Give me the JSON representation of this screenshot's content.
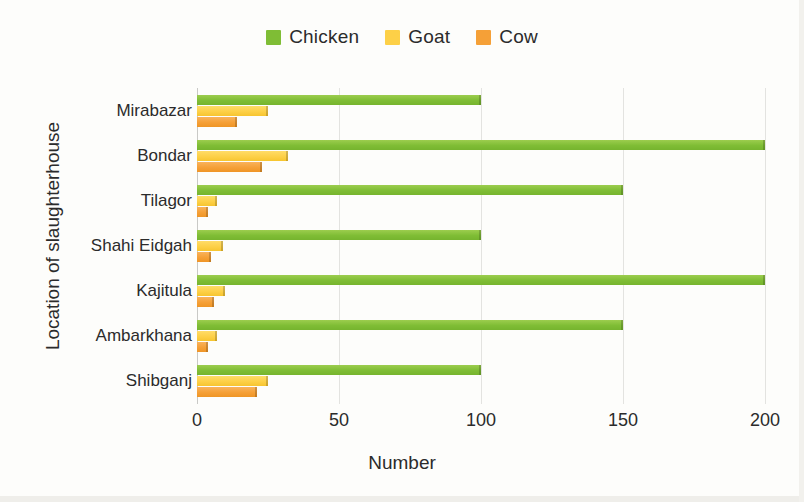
{
  "chart_data": {
    "type": "bar",
    "orientation": "horizontal",
    "title": "",
    "xlabel": "Number",
    "ylabel": "Location of slaughterhouse",
    "xlim": [
      0,
      200
    ],
    "xticks": [
      0,
      50,
      100,
      150,
      200
    ],
    "grid": true,
    "legend_position": "top-center",
    "categories": [
      "Mirabazar",
      "Bondar",
      "Tilagor",
      "Shahi Eidgah",
      "Kajitula",
      "Ambarkhana",
      "Shibganj"
    ],
    "series": [
      {
        "name": "Chicken",
        "color": "#7fbd35",
        "values": [
          100,
          200,
          150,
          100,
          200,
          150,
          100
        ]
      },
      {
        "name": "Goat",
        "color": "#fdd047",
        "values": [
          25,
          32,
          7,
          9,
          10,
          7,
          25
        ]
      },
      {
        "name": "Cow",
        "color": "#f5a037",
        "values": [
          14,
          23,
          4,
          5,
          6,
          4,
          21
        ]
      }
    ]
  },
  "legend": {
    "entries": [
      {
        "label": "Chicken",
        "color": "#7fbd35"
      },
      {
        "label": "Goat",
        "color": "#fdd047"
      },
      {
        "label": "Cow",
        "color": "#f5a037"
      }
    ]
  },
  "axes": {
    "x_title": "Number",
    "y_title": "Location of slaughterhouse",
    "x_tick_labels": [
      "0",
      "50",
      "100",
      "150",
      "200"
    ],
    "y_tick_labels": [
      "Mirabazar",
      "Bondar",
      "Tilagor",
      "Shahi Eidgah",
      "Kajitula",
      "Ambarkhana",
      "Shibganj"
    ]
  }
}
